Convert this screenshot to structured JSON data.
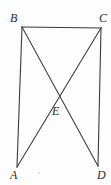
{
  "figure": {
    "background_color": "#fdfdfd",
    "stroke_color": "#3a3a3a",
    "label_color": "#2a2a2a",
    "stroke_width": 1,
    "width": 111,
    "height": 185,
    "points": {
      "A": {
        "label": "A",
        "x": 17,
        "y": 167,
        "label_x": 10,
        "label_y": 169
      },
      "B": {
        "label": "B",
        "x": 22,
        "y": 27,
        "label_x": 10,
        "label_y": 12
      },
      "C": {
        "label": "C",
        "x": 101,
        "y": 28,
        "label_x": 99,
        "label_y": 12
      },
      "D": {
        "label": "D",
        "x": 98,
        "y": 166,
        "label_x": 97,
        "label_y": 169
      },
      "E": {
        "label": "E",
        "x": 59,
        "y": 95,
        "label_x": 52,
        "label_y": 105
      }
    },
    "segments": [
      {
        "name": "segment-BC",
        "from": "B",
        "to": "C",
        "d": "M 22 27 L 101 28"
      },
      {
        "name": "segment-AB",
        "from": "A",
        "to": "B",
        "d": "M 22 27 L 17 167"
      },
      {
        "name": "segment-CD",
        "from": "C",
        "to": "D",
        "d": "M 101 28 L 98 166"
      },
      {
        "name": "segment-BD",
        "from": "B",
        "to": "D",
        "d": "M 22 27 L 98 166"
      },
      {
        "name": "segment-CA",
        "from": "C",
        "to": "A",
        "d": "M 101 28 L 17 167"
      }
    ],
    "artifact": {
      "x": 38,
      "y": 172
    }
  }
}
